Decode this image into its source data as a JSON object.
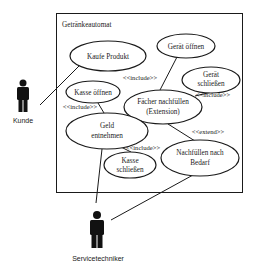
{
  "system": {
    "name": "Getränkeautomat"
  },
  "actors": [
    {
      "id": "kunde",
      "label": "Kunde"
    },
    {
      "id": "servicetechniker",
      "label": "Servicetechniker"
    }
  ],
  "use_cases": {
    "kaufe_produkt": {
      "lines": [
        "Kaufe Produkt"
      ]
    },
    "geraet_oeffnen": {
      "lines": [
        "Gerät öffnen"
      ]
    },
    "geraet_schliessen": {
      "lines": [
        "Gerät",
        "schließen"
      ]
    },
    "kasse_oeffnen": {
      "lines": [
        "Kasse öffnen"
      ]
    },
    "faecher_nachfuellen": {
      "lines": [
        "Fächer nachfüllen",
        "(Extension)"
      ]
    },
    "geld_entnehmen": {
      "lines": [
        "Geld",
        "entnehmen"
      ]
    },
    "kasse_schliessen": {
      "lines": [
        "Kasse",
        "schließen"
      ]
    },
    "nachfuellen_nach_bedarf": {
      "lines": [
        "Nachfüllen nach",
        "Bedarf"
      ]
    }
  },
  "relations": {
    "include_upper": "<<include>>",
    "include_right": "<<include>>",
    "include_left": "<<include>>",
    "include_lower": "<<include>>",
    "extend": "<<extend>>"
  },
  "connections": [
    {
      "from": "Kunde",
      "to": "Kaufe Produkt",
      "type": "association"
    },
    {
      "from": "Servicetechniker",
      "to": "Geld entnehmen",
      "type": "association"
    },
    {
      "from": "Servicetechniker",
      "to": "Nachfüllen nach Bedarf",
      "type": "association"
    },
    {
      "from": "Fächer nachfüllen (Extension)",
      "to": "Gerät öffnen",
      "type": "include"
    },
    {
      "from": "Fächer nachfüllen (Extension)",
      "to": "Gerät schließen",
      "type": "include"
    },
    {
      "from": "Geld entnehmen",
      "to": "Kasse öffnen",
      "type": "include"
    },
    {
      "from": "Geld entnehmen",
      "to": "Kasse schließen",
      "type": "include"
    },
    {
      "from": "Nachfüllen nach Bedarf",
      "to": "Fächer nachfüllen (Extension)",
      "type": "extend"
    }
  ]
}
